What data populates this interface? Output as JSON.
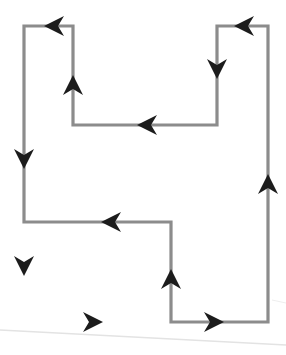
{
  "figure": {
    "type": "diagram",
    "orientation": "counterclockwise",
    "canvas": {
      "width": 286,
      "height": 355
    },
    "colors": {
      "background": "#ffffff",
      "stroke": "#8c8c8c",
      "arrowhead": "#1c1c1c",
      "artifact": "#e3e3e3"
    },
    "stroke_width": 3.2
  },
  "shape": {
    "name": "closed-rectilinear-polygon",
    "vertex_count": 10,
    "vertices": [
      {
        "id": "v1",
        "x": 24,
        "y": 26,
        "label": "top-left-outer"
      },
      {
        "id": "v2",
        "x": 73,
        "y": 26,
        "label": "top-notch-left-top"
      },
      {
        "id": "v3",
        "x": 73,
        "y": 125,
        "label": "top-notch-left-bottom"
      },
      {
        "id": "v4",
        "x": 217,
        "y": 125,
        "label": "top-notch-right-bottom"
      },
      {
        "id": "v5",
        "x": 217,
        "y": 26,
        "label": "top-notch-right-top"
      },
      {
        "id": "v6",
        "x": 268,
        "y": 26,
        "label": "top-right-outer"
      },
      {
        "id": "v7",
        "x": 268,
        "y": 322,
        "label": "bottom-right-outer"
      },
      {
        "id": "v8",
        "x": 171,
        "y": 322,
        "label": "bottom-notch-right"
      },
      {
        "id": "v9",
        "x": 171,
        "y": 222,
        "label": "bottom-notch-top-right"
      },
      {
        "id": "v10",
        "x": 24,
        "y": 222,
        "label": "bottom-notch-top-left"
      }
    ],
    "path_d": "M 24 26 L 73 26 L 73 125 L 217 125 L 217 26 L 268 26 L 268 322 L 171 322 L 171 222 L 24 222 Z"
  },
  "arrows": [
    {
      "id": "a1",
      "x": 55,
      "y": 26,
      "direction": "left",
      "rotation": 180,
      "on_edge": "v1-v2",
      "name": "arrow-top-left-segment"
    },
    {
      "id": "a2",
      "x": 73,
      "y": 86,
      "direction": "up",
      "rotation": 270,
      "on_edge": "v3-v2",
      "name": "arrow-notch-left-vertical"
    },
    {
      "id": "a3",
      "x": 148,
      "y": 125,
      "direction": "left",
      "rotation": 180,
      "on_edge": "v4-v3",
      "name": "arrow-notch-bottom"
    },
    {
      "id": "a4",
      "x": 217,
      "y": 68,
      "direction": "down",
      "rotation": 90,
      "on_edge": "v5-v4",
      "name": "arrow-notch-right-vertical"
    },
    {
      "id": "a5",
      "x": 245,
      "y": 26,
      "direction": "left",
      "rotation": 180,
      "on_edge": "v6-v5",
      "name": "arrow-top-right-segment"
    },
    {
      "id": "a6",
      "x": 268,
      "y": 185,
      "direction": "up",
      "rotation": 270,
      "on_edge": "v7-v6",
      "name": "arrow-right-edge"
    },
    {
      "id": "a7",
      "x": 213,
      "y": 322,
      "direction": "right",
      "rotation": 0,
      "on_edge": "v8-v7",
      "name": "arrow-bottom-right-segment"
    },
    {
      "id": "a8",
      "x": 171,
      "y": 280,
      "direction": "up",
      "rotation": 270,
      "on_edge": "v8-v9",
      "name": "arrow-inner-vertical"
    },
    {
      "id": "a9",
      "x": 112,
      "y": 222,
      "direction": "left",
      "rotation": 180,
      "on_edge": "v9-v10",
      "name": "arrow-inner-horizontal"
    },
    {
      "id": "a10",
      "x": 24,
      "y": 158,
      "direction": "down",
      "rotation": 90,
      "on_edge": "v1-v10",
      "name": "arrow-left-edge-upper"
    },
    {
      "id": "a11",
      "x": 24,
      "y": 265,
      "direction": "down",
      "rotation": 90,
      "on_edge": "v10-bottom",
      "name": "arrow-left-edge-lower"
    },
    {
      "id": "a12",
      "x": 92,
      "y": 322,
      "direction": "right",
      "rotation": 0,
      "on_edge": "bottom-left",
      "name": "arrow-bottom-left-segment"
    }
  ],
  "artifacts": [
    {
      "id": "scan-line-1",
      "name": "scan-artifact-diagonal",
      "d": "M 0 330 L 286 345"
    },
    {
      "id": "scan-line-2",
      "name": "scan-artifact-faint",
      "d": "M 272 300 L 286 303"
    }
  ]
}
